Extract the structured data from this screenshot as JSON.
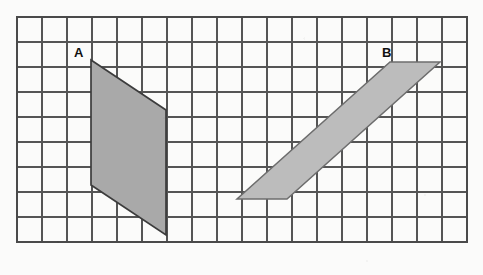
{
  "figure": {
    "background_color": "#fbfbfa",
    "grid": {
      "origin_x": 17,
      "origin_y": 17,
      "cell_size": 25,
      "columns": 18,
      "rows": 9,
      "line_color": "#555555",
      "line_width": 1.1,
      "border_color": "#4a4a4a",
      "border_width": 1.6,
      "grid_shown": true
    },
    "shapes": [
      {
        "id": "shape-a",
        "label": "A",
        "label_x": 74,
        "label_y": 57,
        "type": "parallelogram",
        "fill_color": "#a9a9a9",
        "stroke_color": "#3c3c3c",
        "stroke_width": 1.7,
        "points_px": "91,60 166,110 166,235 91,185",
        "grid_vertices": [
          [
            3,
            1.7
          ],
          [
            6,
            3.7
          ],
          [
            6,
            8.7
          ],
          [
            3,
            6.7
          ]
        ],
        "base_cells": 5,
        "width_cells": 3,
        "slant_cells": 2
      },
      {
        "id": "shape-b",
        "label": "B",
        "label_x": 382,
        "label_y": 57,
        "type": "parallelogram",
        "fill_color": "#bcbcbc",
        "stroke_color": "#6d6d6d",
        "stroke_width": 1.5,
        "points_px": "390,62 440,62 287,199 237,199",
        "grid_vertices": [
          [
            15,
            1.8
          ],
          [
            17,
            1.8
          ],
          [
            11,
            7.3
          ],
          [
            9,
            7.3
          ]
        ],
        "base_cells": 2,
        "slant_run_cells": 6,
        "slant_rise_cells": 5.5
      }
    ]
  }
}
